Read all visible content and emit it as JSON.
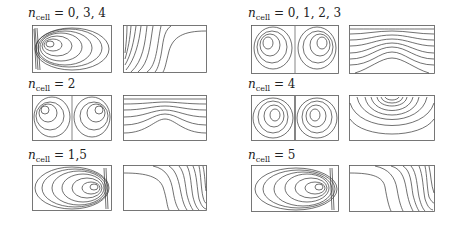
{
  "figure": {
    "panels": [
      {
        "id": "p1",
        "label_var": "n",
        "label_sub": "cell",
        "label_value": "= 0, 3, 4",
        "pattern": "single-cell-left"
      },
      {
        "id": "p2",
        "label_var": "n",
        "label_sub": "cell",
        "label_value": "= 0, 1, 2, 3",
        "pattern": "two-cell"
      },
      {
        "id": "p3",
        "label_var": "n",
        "label_sub": "cell",
        "label_value": "= 2",
        "pattern": "two-cell"
      },
      {
        "id": "p4",
        "label_var": "n",
        "label_sub": "cell",
        "label_value": "= 4",
        "pattern": "two-cell-plume"
      },
      {
        "id": "p5",
        "label_var": "n",
        "label_sub": "cell",
        "label_value": "= 1,5",
        "pattern": "single-cell-right"
      },
      {
        "id": "p6",
        "label_var": "n",
        "label_sub": "cell",
        "label_value": "= 5",
        "pattern": "single-cell-right"
      }
    ],
    "subplot_types": [
      "streamlines",
      "isotherms"
    ]
  }
}
